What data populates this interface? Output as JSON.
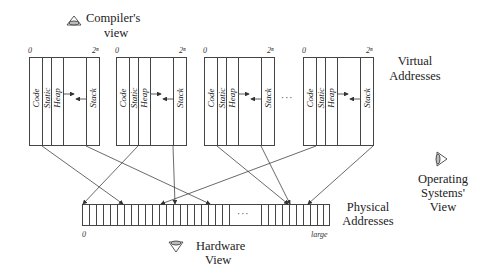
{
  "views": {
    "compiler": {
      "line1": "Compiler's",
      "line2": "view",
      "icon": "eye-icon"
    },
    "hardware": {
      "line1": "Hardware",
      "line2": "View",
      "icon": "eye-icon"
    },
    "os": {
      "line1": "Operating",
      "line2": "Systems'",
      "line3": "View",
      "icon": "eye-icon"
    }
  },
  "virtual": {
    "label_line1": "Virtual",
    "label_line2": "Addresses",
    "start_tick": "0",
    "end_tick": "2ⁿ",
    "segments": [
      "Code",
      "Static",
      "Heap",
      "Stack"
    ],
    "ellipsis": "···"
  },
  "physical": {
    "label_line1": "Physical",
    "label_line2": "Addresses",
    "start_tick": "0",
    "end_tick": "large",
    "ellipsis": "···"
  },
  "colors": {
    "line": "#333333",
    "background": "#ffffff"
  }
}
